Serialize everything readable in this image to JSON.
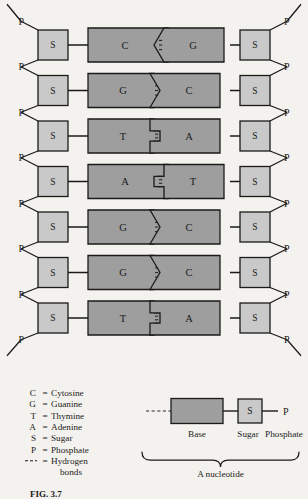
{
  "figure": {
    "title_caption": "FIG. 3.7",
    "nucleotide_label": "A nucleotide"
  },
  "colors": {
    "background": "#f4f2ee",
    "base_fill": "#9e9e9e",
    "sugar_fill": "#c9c9c9",
    "stroke": "#1a1a1a",
    "bond_stroke": "#2a2a2a"
  },
  "backbone": {
    "phosphate_label": "P",
    "sugar_label": "S"
  },
  "ladder": {
    "rows": [
      {
        "left_base": "C",
        "right_base": "G",
        "bonds": 3,
        "left_shape": "notch",
        "right_shape": "point"
      },
      {
        "left_base": "G",
        "right_base": "C",
        "bonds": 3,
        "left_shape": "point",
        "right_shape": "notch"
      },
      {
        "left_base": "T",
        "right_base": "A",
        "bonds": 2,
        "left_shape": "tab",
        "right_shape": "slot"
      },
      {
        "left_base": "A",
        "right_base": "T",
        "bonds": 2,
        "left_shape": "slot",
        "right_shape": "tab"
      },
      {
        "left_base": "G",
        "right_base": "C",
        "bonds": 3,
        "left_shape": "point",
        "right_shape": "notch"
      },
      {
        "left_base": "G",
        "right_base": "C",
        "bonds": 3,
        "left_shape": "point",
        "right_shape": "notch"
      },
      {
        "left_base": "T",
        "right_base": "A",
        "bonds": 2,
        "left_shape": "tab",
        "right_shape": "slot"
      }
    ]
  },
  "legend": {
    "entries": [
      {
        "symbol": "C",
        "eq": "=",
        "word": "Cytosine"
      },
      {
        "symbol": "G",
        "eq": "=",
        "word": "Guanine"
      },
      {
        "symbol": "T",
        "eq": "=",
        "word": "Thymine"
      },
      {
        "symbol": "A",
        "eq": "=",
        "word": "Adenine"
      },
      {
        "symbol": "S",
        "eq": "=",
        "word": "Sugar"
      },
      {
        "symbol": "P",
        "eq": "=",
        "word": "Phosphate"
      },
      {
        "symbol": "---",
        "eq": "=",
        "word": "Hydrogen"
      }
    ],
    "continuation": "bonds"
  },
  "nucleotide_diagram": {
    "base_label": "Base",
    "sugar_label": "Sugar",
    "phosphate_label": "Phosphate",
    "sugar_letter": "S",
    "phosphate_letter": "P"
  }
}
